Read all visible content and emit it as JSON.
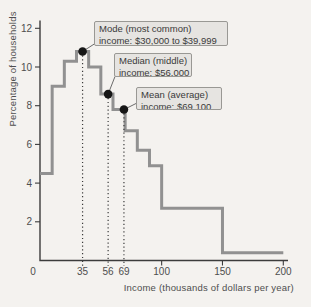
{
  "chart_data": {
    "type": "line",
    "subtype": "step-histogram-outline",
    "title": "",
    "xlabel": "Income (thousands of dollars per year)",
    "ylabel": "Percentage of households",
    "bin_edges": [
      0,
      10,
      20,
      30,
      40,
      50,
      60,
      70,
      80,
      90,
      100,
      150,
      200
    ],
    "values": [
      4.5,
      9.0,
      10.3,
      10.8,
      10.0,
      8.6,
      7.8,
      6.7,
      5.7,
      4.9,
      2.7,
      0.4
    ],
    "xticks": [
      0,
      35,
      56,
      69,
      100,
      150,
      200
    ],
    "yticks": [
      2,
      4,
      6,
      8,
      10,
      12
    ],
    "xlim": [
      0,
      204
    ],
    "ylim": [
      0,
      12.4
    ],
    "grid": false,
    "legend": "none",
    "annotations": [
      {
        "name": "mode",
        "text_line1": "Mode (most common)",
        "text_line2": "income: $30,000 to $39,999",
        "at_x": 35,
        "at_y": 10.8
      },
      {
        "name": "median",
        "text_line1": "Median (middle)",
        "text_line2": "income: $56,000",
        "at_x": 56,
        "at_y": 8.6
      },
      {
        "name": "mean",
        "text_line1": "Mean (average)",
        "text_line2": "income: $69,100",
        "at_x": 69,
        "at_y": 7.8
      }
    ],
    "colors": {
      "background": "#f4f2ef",
      "step_line": "#919191",
      "axis": "#3c3c3c",
      "tick_text": "#4e4e4e",
      "dot": "#161616",
      "dotted_guide": "#3b3b3b",
      "leader": "#6b6b6b",
      "callout_bg": "#e6e4e1",
      "callout_border": "#999894",
      "callout_text": "#3a3a3a"
    },
    "layout_hints": {
      "x0": 40,
      "y0": 260.5,
      "y_top": 20.5,
      "x_end": 288,
      "x_per_unit": 1.2165,
      "y_per_unit": 19.35,
      "zero_label_x": 33,
      "callouts": [
        {
          "left": 94,
          "top": 21,
          "width": 134,
          "height": 25,
          "leader_x": 95,
          "leader_y": 43.5
        },
        {
          "left": 114,
          "top": 53,
          "width": 78,
          "height": 24,
          "leader_x": 115,
          "leader_y": 76.5
        },
        {
          "left": 136,
          "top": 87,
          "width": 86,
          "height": 23,
          "leader_x": 137,
          "leader_y": 103
        }
      ]
    }
  }
}
